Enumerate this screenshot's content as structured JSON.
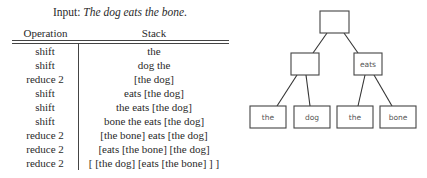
{
  "input": {
    "prefix": "Input: ",
    "sentence": "The dog eats the bone."
  },
  "table": {
    "headers": {
      "operation": "Operation",
      "stack": "Stack"
    },
    "rows": [
      {
        "operation": "shift",
        "stack": "the"
      },
      {
        "operation": "shift",
        "stack": "dog the"
      },
      {
        "operation": "reduce 2",
        "stack": "[the dog]"
      },
      {
        "operation": "shift",
        "stack": "eats [the dog]"
      },
      {
        "operation": "shift",
        "stack": "the eats [the dog]"
      },
      {
        "operation": "shift",
        "stack": "bone the eats [the dog]"
      },
      {
        "operation": "reduce 2",
        "stack": "[the bone] eats [the dog]"
      },
      {
        "operation": "reduce 2",
        "stack": "[eats [the bone] [the dog]"
      },
      {
        "operation": "reduce 2",
        "stack": "[ [the dog] [eats [the bone] ] ]"
      }
    ]
  },
  "tree": {
    "nodes": [
      {
        "id": "root",
        "label": "",
        "x": 320,
        "y": 11,
        "w": 29,
        "h": 22
      },
      {
        "id": "np1",
        "label": "",
        "x": 291,
        "y": 53,
        "w": 28,
        "h": 22
      },
      {
        "id": "vp",
        "label": "eats",
        "x": 354,
        "y": 53,
        "w": 28,
        "h": 22
      },
      {
        "id": "the1",
        "label": "the",
        "x": 250,
        "y": 106,
        "w": 36,
        "h": 22
      },
      {
        "id": "dog",
        "label": "dog",
        "x": 294,
        "y": 106,
        "w": 36,
        "h": 22
      },
      {
        "id": "the2",
        "label": "the",
        "x": 337,
        "y": 106,
        "w": 36,
        "h": 22
      },
      {
        "id": "bone",
        "label": "bone",
        "x": 380,
        "y": 106,
        "w": 36,
        "h": 22
      }
    ],
    "edges": [
      {
        "x1": 327,
        "y1": 33,
        "x2": 313,
        "y2": 53
      },
      {
        "x1": 344,
        "y1": 33,
        "x2": 358,
        "y2": 53
      },
      {
        "x1": 297,
        "y1": 75,
        "x2": 277,
        "y2": 106
      },
      {
        "x1": 306,
        "y1": 75,
        "x2": 310,
        "y2": 106
      },
      {
        "x1": 365,
        "y1": 75,
        "x2": 358,
        "y2": 106
      },
      {
        "x1": 374,
        "y1": 75,
        "x2": 392,
        "y2": 106
      }
    ]
  }
}
